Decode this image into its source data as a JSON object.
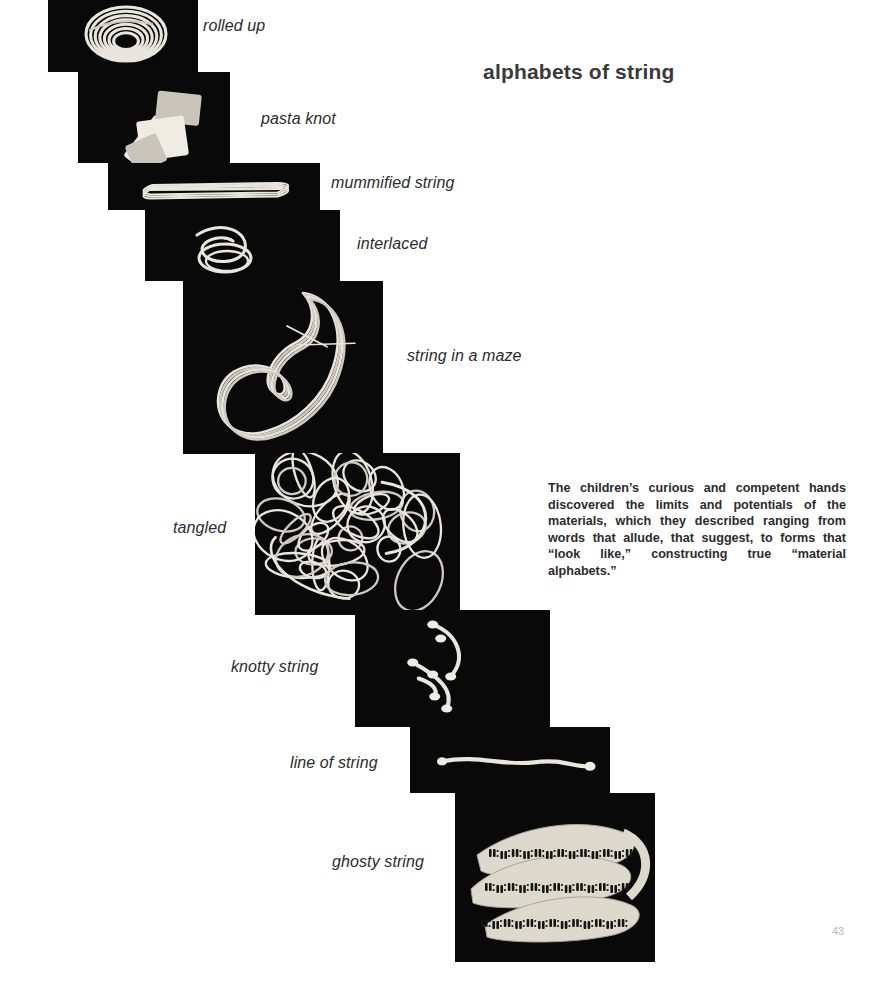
{
  "page": {
    "title": "alphabets of string",
    "page_number": "43",
    "body_text": "The children’s curious and competent hands discovered the limits and potentials of the materials, which they described ranging from words that allude, that suggest, to forms that “look like,” constructing true “material alphabets.”",
    "background_color": "#ffffff",
    "title_color": "#3a3a3a",
    "text_color": "#2b2b2b",
    "page_number_color": "#b9b9b9",
    "photo_background_color": "#090909",
    "string_color": "#e9e6dd"
  },
  "photos": [
    {
      "id": "rolled-up",
      "caption": "rolled up",
      "art": "coil",
      "frame": {
        "left": 48,
        "top": 0,
        "width": 150,
        "height": 72
      },
      "caption_pos": {
        "left": 203,
        "top": 17
      },
      "caption_size": 16
    },
    {
      "id": "pasta-knot",
      "caption": "pasta knot",
      "art": "pasta",
      "frame": {
        "left": 78,
        "top": 72,
        "width": 152,
        "height": 91
      },
      "caption_pos": {
        "left": 261,
        "top": 110
      },
      "caption_size": 16
    },
    {
      "id": "mummified-string",
      "caption": "mummified string",
      "art": "mummified",
      "frame": {
        "left": 108,
        "top": 163,
        "width": 212,
        "height": 47
      },
      "caption_pos": {
        "left": 331,
        "top": 174
      },
      "caption_size": 16
    },
    {
      "id": "interlaced",
      "caption": "interlaced",
      "art": "interlaced",
      "frame": {
        "left": 145,
        "top": 210,
        "width": 195,
        "height": 71
      },
      "caption_pos": {
        "left": 357,
        "top": 235
      },
      "caption_size": 16
    },
    {
      "id": "string-in-a-maze",
      "caption": "string in a maze",
      "art": "maze",
      "frame": {
        "left": 183,
        "top": 281,
        "width": 200,
        "height": 173
      },
      "caption_pos": {
        "left": 407,
        "top": 347
      },
      "caption_size": 16
    },
    {
      "id": "tangled",
      "caption": "tangled",
      "art": "tangled",
      "frame": {
        "left": 255,
        "top": 453,
        "width": 205,
        "height": 162
      },
      "caption_pos": {
        "left": 173,
        "top": 519
      },
      "caption_size": 16
    },
    {
      "id": "knotty-string",
      "caption": "knotty string",
      "art": "knotty",
      "frame": {
        "left": 355,
        "top": 610,
        "width": 195,
        "height": 117
      },
      "caption_pos": {
        "left": 231,
        "top": 658
      },
      "caption_size": 16
    },
    {
      "id": "line-of-string",
      "caption": "line of string",
      "art": "line",
      "frame": {
        "left": 410,
        "top": 727,
        "width": 200,
        "height": 66
      },
      "caption_pos": {
        "left": 290,
        "top": 754
      },
      "caption_size": 16
    },
    {
      "id": "ghosty-string",
      "caption": "ghosty string",
      "art": "ghosty",
      "frame": {
        "left": 455,
        "top": 793,
        "width": 200,
        "height": 169
      },
      "caption_pos": {
        "left": 332,
        "top": 853
      },
      "caption_size": 16
    }
  ]
}
